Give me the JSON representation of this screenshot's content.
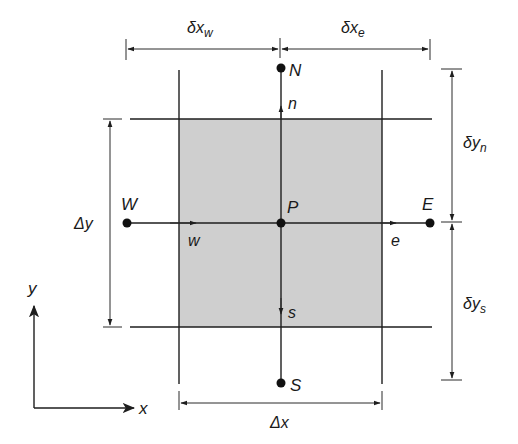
{
  "diagram": {
    "type": "finite-volume control volume (2D)",
    "colors": {
      "cell_fill": "#cfcfcf",
      "line": "#1e1e1e",
      "background": "#ffffff"
    },
    "nodes": {
      "P": "P",
      "N": "N",
      "S": "S",
      "E": "E",
      "W": "W"
    },
    "faces": {
      "n": "n",
      "s": "s",
      "e": "e",
      "w": "w"
    },
    "dimensions": {
      "dx_w": "δx",
      "dx_w_sub": "w",
      "dx_e": "δx",
      "dx_e_sub": "e",
      "dy_n": "δy",
      "dy_n_sub": "n",
      "dy_s": "δy",
      "dy_s_sub": "s",
      "delta_x": "Δx",
      "delta_y": "Δy"
    },
    "axes": {
      "x": "x",
      "y": "y"
    }
  }
}
